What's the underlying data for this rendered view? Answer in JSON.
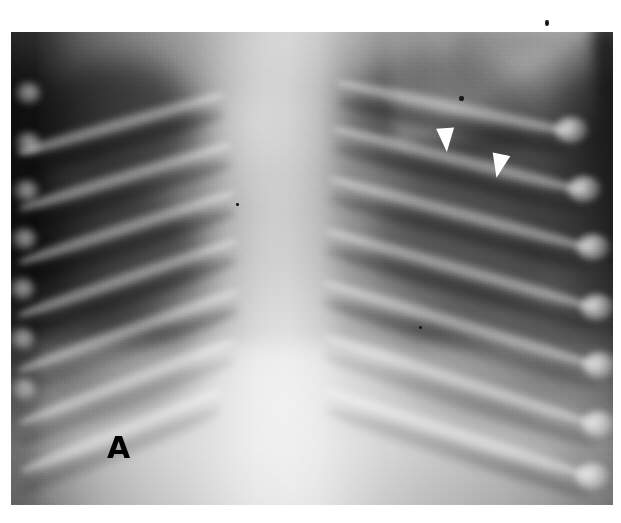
{
  "figure": {
    "kind": "radiograph",
    "modality": "chest-xray",
    "panel_label": "A",
    "background_color": "#ffffff",
    "plate": {
      "left": 11,
      "top": 32,
      "width": 602,
      "height": 473,
      "dark_tone": "#0f0f0f",
      "mid_tone": "#8a8a8a",
      "bright_tone": "#cfcfcf"
    },
    "panel_label_position": {
      "x": 107,
      "y": 433
    },
    "annotations": {
      "arrowhead_color": "#ffffff",
      "markers": [
        {
          "name": "arrowhead-upper",
          "x": 437,
          "y": 128,
          "rotation": -4
        },
        {
          "name": "arrowhead-lower",
          "x": 490,
          "y": 154,
          "rotation": 12
        }
      ],
      "specks": [
        {
          "x": 459,
          "y": 96,
          "w": 5,
          "h": 5
        },
        {
          "x": 545,
          "y": 20,
          "w": 4,
          "h": 6
        },
        {
          "x": 236,
          "y": 203,
          "w": 3,
          "h": 3
        },
        {
          "x": 419,
          "y": 326,
          "w": 3,
          "h": 3
        }
      ]
    },
    "ribs_left": [
      {
        "top": 54,
        "left": -2,
        "width": 215,
        "rot": 16
      },
      {
        "top": 104,
        "left": -2,
        "width": 222,
        "rot": 17
      },
      {
        "top": 152,
        "left": -4,
        "width": 228,
        "rot": 18
      },
      {
        "top": 200,
        "left": -6,
        "width": 232,
        "rot": 19
      },
      {
        "top": 250,
        "left": -8,
        "width": 236,
        "rot": 20
      },
      {
        "top": 300,
        "left": -8,
        "width": 232,
        "rot": 21
      },
      {
        "top": 350,
        "left": -6,
        "width": 216,
        "rot": 22
      }
    ],
    "ribs_right": [
      {
        "top": 42,
        "left": 326,
        "width": 238,
        "rot": 12
      },
      {
        "top": 88,
        "left": 322,
        "width": 258,
        "rot": 14
      },
      {
        "top": 138,
        "left": 318,
        "width": 272,
        "rot": 15
      },
      {
        "top": 190,
        "left": 314,
        "width": 282,
        "rot": 16
      },
      {
        "top": 242,
        "left": 312,
        "width": 288,
        "rot": 17
      },
      {
        "top": 296,
        "left": 312,
        "width": 288,
        "rot": 18
      },
      {
        "top": 350,
        "left": 314,
        "width": 280,
        "rot": 18
      }
    ]
  }
}
